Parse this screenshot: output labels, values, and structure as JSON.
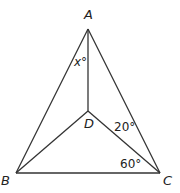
{
  "diagram": {
    "type": "geometry",
    "points": {
      "A": {
        "label": "A",
        "x": 88,
        "y": 29
      },
      "B": {
        "label": "B",
        "x": 16,
        "y": 173
      },
      "C": {
        "label": "C",
        "x": 160,
        "y": 173
      },
      "D": {
        "label": "D",
        "x": 88,
        "y": 111
      }
    },
    "segments": [
      "AB",
      "AC",
      "BC",
      "AD",
      "BD",
      "CD"
    ],
    "angles": {
      "x": {
        "label": "x°",
        "at": "A",
        "between": "BAD"
      },
      "angle_20": {
        "label": "20°",
        "at": "C",
        "between": "ACD"
      },
      "angle_60": {
        "label": "60°",
        "at": "C",
        "between": "DCB"
      }
    },
    "colors": {
      "line": "#333333",
      "text": "#222222"
    }
  }
}
